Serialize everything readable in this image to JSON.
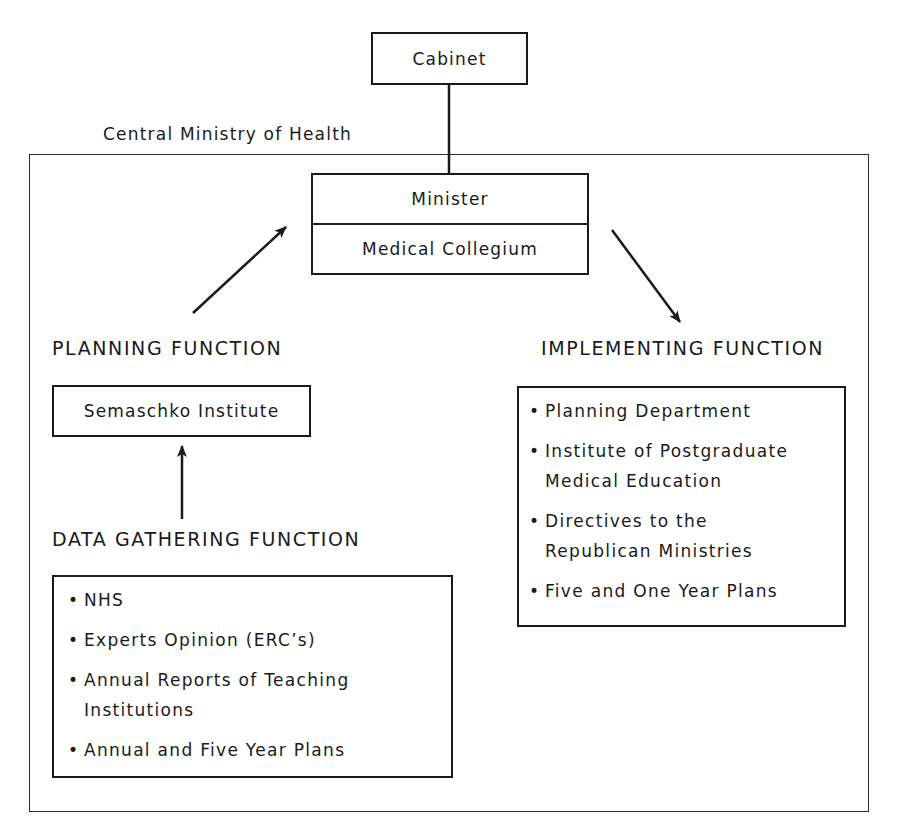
{
  "diagram": {
    "top_node": {
      "label": "Cabinet"
    },
    "frame": {
      "label": "Central Ministry of Health"
    },
    "ministry_box": {
      "top_label": "Minister",
      "bottom_label": "Medical Collegium"
    },
    "planning": {
      "heading": "PLANNING FUNCTION",
      "box_label": "Semaschko Institute"
    },
    "data_gathering": {
      "heading": "DATA GATHERING FUNCTION",
      "items": [
        "NHS",
        "Experts Opinion (ERC’s)",
        "Annual Reports of Teaching Institutions",
        "Annual and Five Year Plans"
      ]
    },
    "implementing": {
      "heading": "IMPLEMENTING FUNCTION",
      "items": [
        "Planning Department",
        "Institute of Postgraduate Medical Education",
        "Directives to the Republican Ministries",
        "Five and One Year Plans"
      ]
    },
    "edges": [
      {
        "from": "Cabinet",
        "to": "Minister",
        "type": "line"
      },
      {
        "from": "Semaschko Institute",
        "to": "Minister / Medical Collegium",
        "type": "arrow"
      },
      {
        "from": "Minister / Medical Collegium",
        "to": "Implementing Function",
        "type": "arrow"
      },
      {
        "from": "Data Gathering Function",
        "to": "Semaschko Institute",
        "type": "arrow"
      }
    ]
  }
}
